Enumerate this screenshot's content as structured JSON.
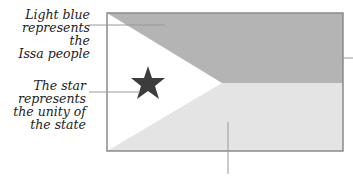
{
  "labels": {
    "light_blue": {
      "lines": [
        "Light blue",
        "represents the",
        "Issa people"
      ]
    },
    "star": {
      "lines": [
        "The star",
        "represents",
        "the unity of",
        "the state"
      ]
    }
  },
  "flag": {
    "top_color": "#b4b4b4",
    "bottom_color": "#e4e4e4",
    "triangle_color": "#ffffff",
    "star_color": "#3c3c3c",
    "border_color": "#8a8a8a"
  },
  "leader_line_color": "#999999"
}
